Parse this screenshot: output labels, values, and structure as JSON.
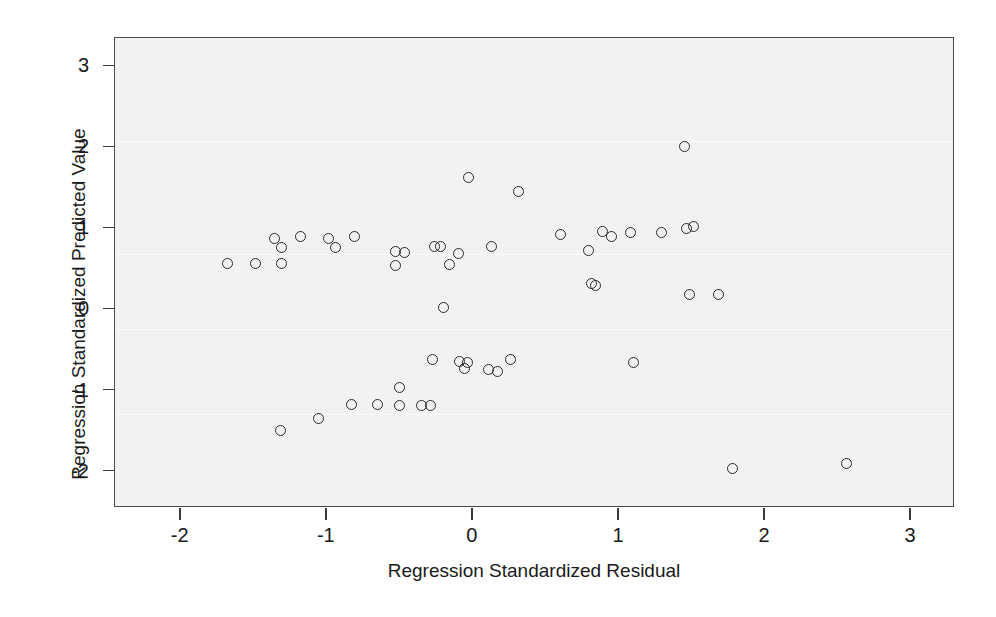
{
  "figure": {
    "background_color": "#ffffff",
    "plot_background_color": "#f2f2f2",
    "marker_color": "#2b2b2b",
    "axis_color": "#4a4a4a"
  },
  "chart_data": {
    "type": "scatter",
    "title": "",
    "subtitle": "",
    "xlabel": "Regression Standardized Residual",
    "ylabel": "Regression Standardized Predicted Value",
    "xlim": [
      -2.45,
      3.3
    ],
    "ylim": [
      -2.45,
      3.35
    ],
    "xticks": [
      -2,
      -1,
      0,
      1,
      2,
      3
    ],
    "xtick_labels": [
      "-2",
      "-1",
      "0",
      "1",
      "2",
      "3"
    ],
    "yticks": [
      -2,
      -1,
      0,
      1,
      2,
      3
    ],
    "ytick_labels": [
      "-2",
      "-1",
      "0",
      "1",
      "2",
      "3"
    ],
    "grid": false,
    "legend": null,
    "marker": "open-circle",
    "n_points": 54,
    "points": [
      {
        "x": -1.68,
        "y": 0.57
      },
      {
        "x": -1.49,
        "y": 0.57
      },
      {
        "x": -1.36,
        "y": 0.88
      },
      {
        "x": -1.31,
        "y": 0.76
      },
      {
        "x": -1.31,
        "y": 0.57
      },
      {
        "x": -1.32,
        "y": -1.49
      },
      {
        "x": -1.18,
        "y": 0.9
      },
      {
        "x": -1.06,
        "y": -1.34
      },
      {
        "x": -0.99,
        "y": 0.88
      },
      {
        "x": -0.94,
        "y": 0.77
      },
      {
        "x": -0.81,
        "y": 0.9
      },
      {
        "x": -0.83,
        "y": -1.17
      },
      {
        "x": -0.65,
        "y": -1.17
      },
      {
        "x": -0.53,
        "y": 0.72
      },
      {
        "x": -0.47,
        "y": 0.7
      },
      {
        "x": -0.53,
        "y": 0.54
      },
      {
        "x": -0.5,
        "y": -0.96
      },
      {
        "x": -0.5,
        "y": -1.18
      },
      {
        "x": -0.35,
        "y": -1.18
      },
      {
        "x": -0.29,
        "y": -1.18
      },
      {
        "x": -0.26,
        "y": 0.78
      },
      {
        "x": -0.22,
        "y": 0.78
      },
      {
        "x": -0.16,
        "y": 0.55
      },
      {
        "x": -0.1,
        "y": 0.69
      },
      {
        "x": -0.2,
        "y": 0.02
      },
      {
        "x": -0.28,
        "y": -0.62
      },
      {
        "x": -0.09,
        "y": -0.64
      },
      {
        "x": -0.04,
        "y": -0.66
      },
      {
        "x": -0.06,
        "y": -0.73
      },
      {
        "x": -0.03,
        "y": 1.63
      },
      {
        "x": 0.11,
        "y": -0.74
      },
      {
        "x": 0.17,
        "y": -0.76
      },
      {
        "x": 0.13,
        "y": 0.78
      },
      {
        "x": 0.26,
        "y": -0.62
      },
      {
        "x": 0.31,
        "y": 1.45
      },
      {
        "x": 0.6,
        "y": 0.92
      },
      {
        "x": 0.79,
        "y": 0.73
      },
      {
        "x": 0.81,
        "y": 0.32
      },
      {
        "x": 0.84,
        "y": 0.29
      },
      {
        "x": 0.89,
        "y": 0.96
      },
      {
        "x": 0.95,
        "y": 0.9
      },
      {
        "x": 1.08,
        "y": 0.95
      },
      {
        "x": 1.1,
        "y": -0.65
      },
      {
        "x": 1.29,
        "y": 0.95
      },
      {
        "x": 1.45,
        "y": 2.01
      },
      {
        "x": 1.46,
        "y": 1.0
      },
      {
        "x": 1.51,
        "y": 1.02
      },
      {
        "x": 1.48,
        "y": 0.19
      },
      {
        "x": 1.68,
        "y": 0.19
      },
      {
        "x": 1.78,
        "y": -1.96
      },
      {
        "x": 2.56,
        "y": -1.9
      }
    ]
  },
  "axes": {
    "y_title": "Regression Standardized Predicted Value",
    "x_title": "Regression Standardized Residual"
  }
}
